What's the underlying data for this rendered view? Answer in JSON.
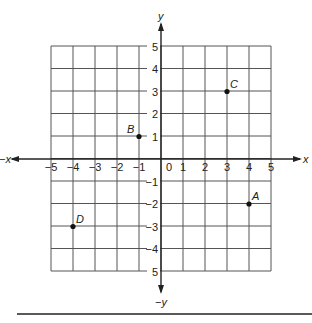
{
  "chart_data": {
    "type": "scatter",
    "title": "",
    "xlabel": "x",
    "ylabel": "y",
    "xlim": [
      -5,
      5
    ],
    "ylim": [
      -5,
      5
    ],
    "grid": true,
    "axis_end_labels": {
      "x_pos": "x",
      "x_neg": "−x",
      "y_pos": "y",
      "y_neg": "−y"
    },
    "x_ticks": [
      "−5",
      "−4",
      "−3",
      "−2",
      "−1",
      "0",
      "1",
      "2",
      "3",
      "4",
      "5"
    ],
    "y_ticks": [
      "5",
      "4",
      "3",
      "2",
      "1",
      "−1",
      "−2",
      "−3",
      "−4",
      "5"
    ],
    "points": [
      {
        "label": "A",
        "x": 4,
        "y": -2
      },
      {
        "label": "B",
        "x": -1,
        "y": 1
      },
      {
        "label": "C",
        "x": 3,
        "y": 3
      },
      {
        "label": "D",
        "x": -4,
        "y": -3
      }
    ]
  },
  "colors": {
    "grid": "#555555",
    "axis": "#222222",
    "point": "#111111"
  }
}
